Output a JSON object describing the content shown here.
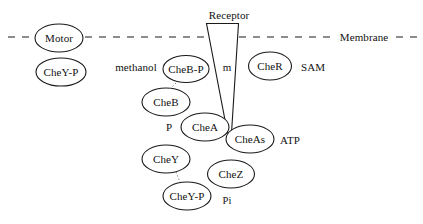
{
  "diagram": {
    "stroke_color": "#1a1a1a",
    "text_color": "#111111",
    "background_color": "#ffffff",
    "membrane": {
      "label": "Membrane",
      "style": "dashed",
      "y": 37
    },
    "receptor": {
      "label": "Receptor",
      "shape": "funnel"
    },
    "nodes": [
      {
        "id": "motor",
        "label": "Motor",
        "cx": 59,
        "cy": 38,
        "rx": 24,
        "ry": 14
      },
      {
        "id": "cheyp_motor",
        "label": "CheY-P",
        "cx": 61,
        "cy": 72,
        "rx": 25,
        "ry": 14
      },
      {
        "id": "chebp",
        "label": "CheB-P",
        "cx": 186,
        "cy": 69,
        "rx": 23,
        "ry": 13.5
      },
      {
        "id": "cher",
        "label": "CheR",
        "cx": 270,
        "cy": 66,
        "rx": 21.5,
        "ry": 14
      },
      {
        "id": "cheb",
        "label": "CheB",
        "cx": 166,
        "cy": 102,
        "rx": 24,
        "ry": 14
      },
      {
        "id": "chea",
        "label": "CheA",
        "cx": 205,
        "cy": 127,
        "rx": 24,
        "ry": 14
      },
      {
        "id": "cheas",
        "label": "CheAs",
        "cx": 250,
        "cy": 139,
        "rx": 24,
        "ry": 14
      },
      {
        "id": "chey",
        "label": "CheY",
        "cx": 166,
        "cy": 159,
        "rx": 24,
        "ry": 14
      },
      {
        "id": "chez",
        "label": "CheZ",
        "cx": 231,
        "cy": 174,
        "rx": 23.5,
        "ry": 14
      },
      {
        "id": "cheyp",
        "label": "CheY-P",
        "cx": 187,
        "cy": 196,
        "rx": 24,
        "ry": 14
      }
    ],
    "free_labels": [
      {
        "id": "methanol",
        "text": "methanol",
        "x": 136,
        "y": 67
      },
      {
        "id": "m",
        "text": "m",
        "x": 227,
        "y": 67
      },
      {
        "id": "sam",
        "text": "SAM",
        "x": 313,
        "y": 67
      },
      {
        "id": "p",
        "text": "P",
        "x": 169,
        "y": 127
      },
      {
        "id": "atp",
        "text": "ATP",
        "x": 290,
        "y": 140
      },
      {
        "id": "pi",
        "text": "Pi",
        "x": 227,
        "y": 200
      }
    ],
    "connectors": [
      {
        "id": "chebp-to-cheb",
        "from": "chebp",
        "to": "cheb",
        "style": "dotted"
      },
      {
        "id": "chey-to-cheyp",
        "from": "chey",
        "to": "cheyp",
        "style": "dotted"
      }
    ]
  }
}
